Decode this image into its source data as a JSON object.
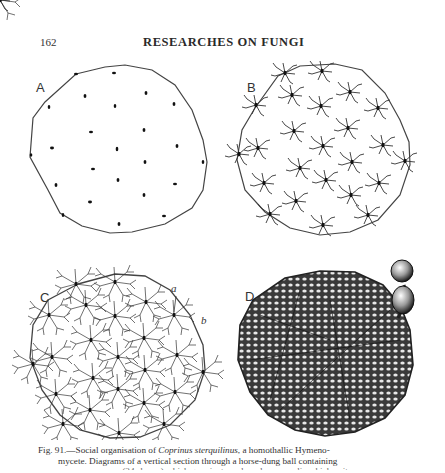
{
  "header": {
    "page_number": "162",
    "running_title": "RESEARCHES ON FUNGI"
  },
  "figure": {
    "panels": [
      {
        "id": "A",
        "label": "A",
        "description": "Sparse spores scattered in a horse-dung ball section"
      },
      {
        "id": "B",
        "label": "B",
        "description": "Germinating spores with short branching hyphae"
      },
      {
        "id": "C",
        "label": "C",
        "description": "Extensive mycelial network connecting germinated spores",
        "annotations": [
          "a",
          "b"
        ]
      },
      {
        "id": "D",
        "label": "D",
        "description": "Dense interwoven mycelium with fruit body primordium",
        "annotations": [
          "a"
        ]
      }
    ]
  },
  "caption": {
    "fig_prefix": "Fig. 91.",
    "line1_pre": "—Social organisation of ",
    "species": "Coprinus sterquilinus",
    "line1_post": ", a homothallic Hymeno-",
    "line2": "mycete.  Diagrams of a vertical section through a horse-dung ball containing",
    "line3": "numerous spores (24 shown) which germinate and produce mycelia which unite"
  }
}
